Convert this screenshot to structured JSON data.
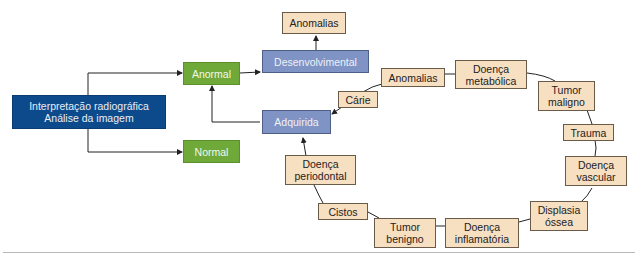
{
  "diagram": {
    "root": {
      "line1": "Interpretação radiográfica",
      "line2": "Análise da imagem"
    },
    "abnormal": "Anormal",
    "normal": "Normal",
    "developmental": "Desenvolvimental",
    "acquired": "Adquirida",
    "developmental_child": "Anomalias",
    "acquired_cycle": [
      "Cárie",
      "Anomalias",
      "Doença\nmetabólica",
      "Tumor\nmaligno",
      "Trauma",
      "Doença\nvascular",
      "Displasia\nóssea",
      "Doença\ninflamatória",
      "Tumor\nbenigno",
      "Cistos",
      "Doença\nperiodontal"
    ]
  },
  "colors": {
    "root": "#0d4a8c",
    "abnormal_normal": "#6fa93a",
    "category": "#7f93c4",
    "condition": "#f7dfc2",
    "line": "#222222"
  }
}
